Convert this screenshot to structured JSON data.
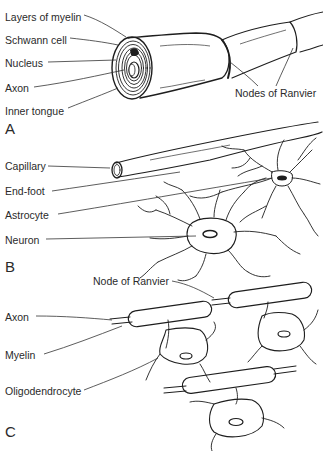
{
  "figure": {
    "panels": [
      {
        "id": "A",
        "letter": "A",
        "labels": {
          "layers_of_myelin": "Layers of myelin",
          "schwann_cell": "Schwann cell",
          "nucleus": "Nucleus",
          "axon": "Axon",
          "inner_tongue": "Inner tongue",
          "nodes_of_ranvier": "Nodes of Ranvier"
        }
      },
      {
        "id": "B",
        "letter": "B",
        "labels": {
          "capillary": "Capillary",
          "end_foot": "End-foot",
          "astrocyte": "Astrocyte",
          "neuron": "Neuron"
        }
      },
      {
        "id": "C",
        "letter": "C",
        "labels": {
          "node_of_ranvier": "Node of Ranvier",
          "axon": "Axon",
          "myelin": "Myelin",
          "oligodendrocyte": "Oligodendrocyte"
        }
      }
    ]
  }
}
